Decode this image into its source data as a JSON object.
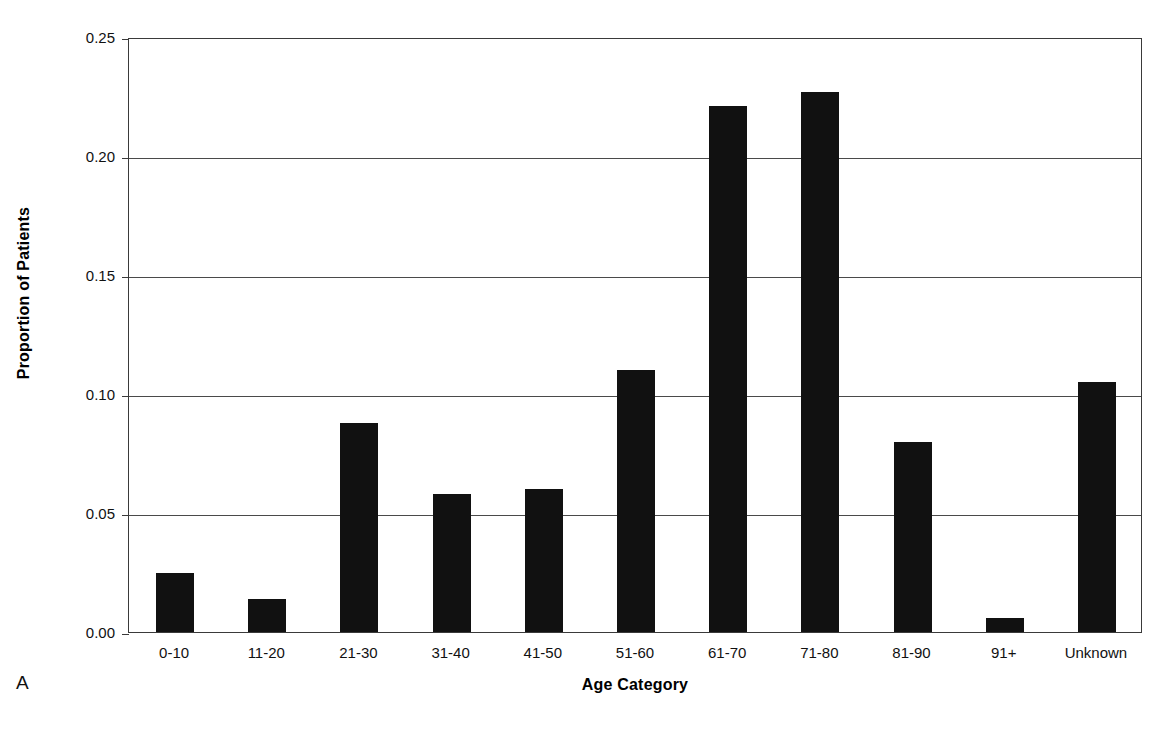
{
  "figure": {
    "panel_label": "A",
    "title_partial": "",
    "ink_color": "#111111",
    "axis_color": "#3a3a3a",
    "background": "#ffffff"
  },
  "chart_data": {
    "type": "bar",
    "title": "",
    "xlabel": "Age Category",
    "ylabel": "Proportion of Patients",
    "categories": [
      "0-10",
      "11-20",
      "21-30",
      "31-40",
      "41-50",
      "51-60",
      "61-70",
      "71-80",
      "81-90",
      "91+",
      "Unknown"
    ],
    "values": [
      0.025,
      0.014,
      0.088,
      0.058,
      0.06,
      0.11,
      0.221,
      0.227,
      0.08,
      0.006,
      0.105
    ],
    "ylim": [
      0.0,
      0.25
    ],
    "ytick_labels": [
      "0.00",
      "0.05",
      "0.10",
      "0.15",
      "0.20",
      "0.25"
    ],
    "ytick_values": [
      0.0,
      0.05,
      0.1,
      0.15,
      0.2,
      0.25
    ],
    "grid": "horizontal",
    "legend": "none",
    "bar_color": "#111111",
    "series": [
      {
        "name": "Proportion of Patients",
        "values": [
          0.025,
          0.014,
          0.088,
          0.058,
          0.06,
          0.11,
          0.221,
          0.227,
          0.08,
          0.006,
          0.105
        ]
      }
    ]
  }
}
